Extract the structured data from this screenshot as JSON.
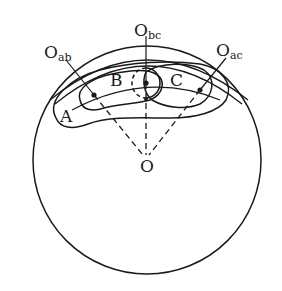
{
  "diagram": {
    "type": "geometric-figure",
    "colors": {
      "stroke": "#1a1a1a",
      "background": "#ffffff"
    },
    "labels": {
      "center": "O",
      "region_a": "A",
      "region_b": "B",
      "region_c": "C",
      "o_ab_main": "O",
      "o_ab_sub": "ab",
      "o_bc_main": "O",
      "o_bc_sub": "bc",
      "o_ac_main": "O",
      "o_ac_sub": "ac"
    }
  }
}
